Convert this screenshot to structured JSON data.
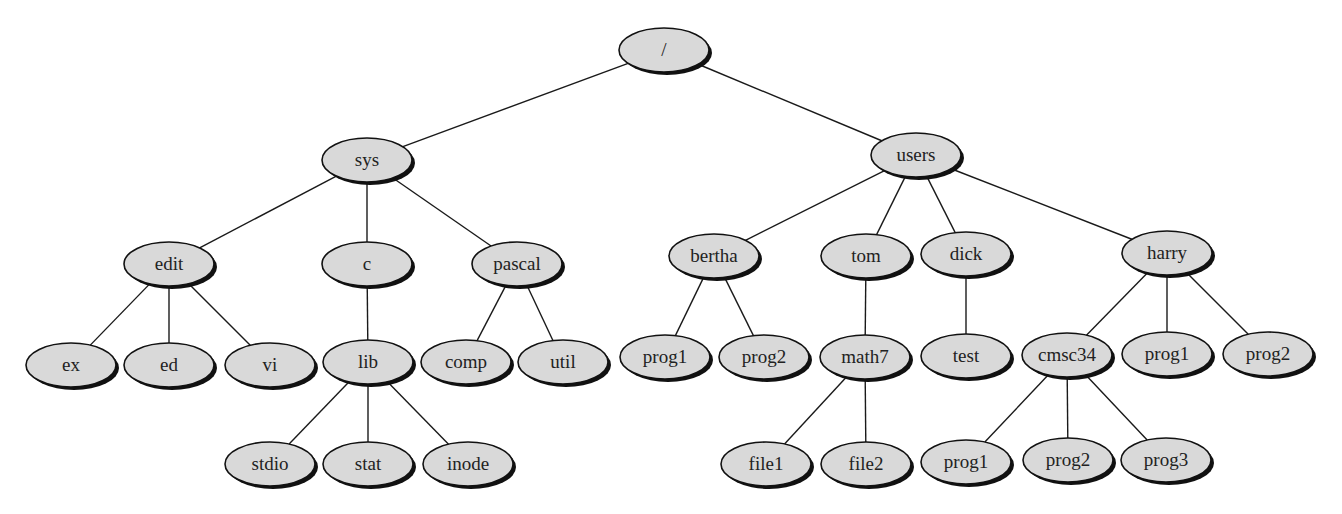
{
  "diagram": {
    "type": "directory-tree",
    "colors": {
      "node_fill": "#d9d9d9",
      "node_stroke": "#111111",
      "edge": "#1a1a1a",
      "background": "#ffffff"
    },
    "nodes": [
      {
        "id": "root",
        "label": "/",
        "x": 664,
        "y": 50,
        "rx": 45,
        "ry": 22
      },
      {
        "id": "sys",
        "label": "sys",
        "x": 367,
        "y": 160,
        "rx": 45,
        "ry": 22
      },
      {
        "id": "users",
        "label": "users",
        "x": 916,
        "y": 155,
        "rx": 45,
        "ry": 22
      },
      {
        "id": "edit",
        "label": "edit",
        "x": 169,
        "y": 264,
        "rx": 45,
        "ry": 22
      },
      {
        "id": "c",
        "label": "c",
        "x": 367,
        "y": 264,
        "rx": 45,
        "ry": 22
      },
      {
        "id": "pascal",
        "label": "pascal",
        "x": 517,
        "y": 264,
        "rx": 45,
        "ry": 22
      },
      {
        "id": "ex",
        "label": "ex",
        "x": 71,
        "y": 365,
        "rx": 45,
        "ry": 22
      },
      {
        "id": "ed",
        "label": "ed",
        "x": 169,
        "y": 365,
        "rx": 45,
        "ry": 22
      },
      {
        "id": "vi",
        "label": "vi",
        "x": 270,
        "y": 365,
        "rx": 45,
        "ry": 22
      },
      {
        "id": "lib",
        "label": "lib",
        "x": 368,
        "y": 362,
        "rx": 45,
        "ry": 22
      },
      {
        "id": "comp",
        "label": "comp",
        "x": 466,
        "y": 362,
        "rx": 45,
        "ry": 22
      },
      {
        "id": "util",
        "label": "util",
        "x": 563,
        "y": 362,
        "rx": 45,
        "ry": 22
      },
      {
        "id": "stdio",
        "label": "stdio",
        "x": 270,
        "y": 464,
        "rx": 45,
        "ry": 22
      },
      {
        "id": "stat",
        "label": "stat",
        "x": 368,
        "y": 464,
        "rx": 45,
        "ry": 22
      },
      {
        "id": "inode",
        "label": "inode",
        "x": 468,
        "y": 464,
        "rx": 45,
        "ry": 22
      },
      {
        "id": "bertha",
        "label": "bertha",
        "x": 714,
        "y": 256,
        "rx": 45,
        "ry": 22
      },
      {
        "id": "tom",
        "label": "tom",
        "x": 866,
        "y": 256,
        "rx": 45,
        "ry": 22
      },
      {
        "id": "dick",
        "label": "dick",
        "x": 966,
        "y": 254,
        "rx": 45,
        "ry": 22
      },
      {
        "id": "harry",
        "label": "harry",
        "x": 1167,
        "y": 253,
        "rx": 45,
        "ry": 22
      },
      {
        "id": "b_prog1",
        "label": "prog1",
        "x": 665,
        "y": 357,
        "rx": 45,
        "ry": 22
      },
      {
        "id": "b_prog2",
        "label": "prog2",
        "x": 764,
        "y": 357,
        "rx": 45,
        "ry": 22
      },
      {
        "id": "math7",
        "label": "math7",
        "x": 865,
        "y": 357,
        "rx": 45,
        "ry": 22
      },
      {
        "id": "test",
        "label": "test",
        "x": 966,
        "y": 356,
        "rx": 45,
        "ry": 22
      },
      {
        "id": "cmsc34",
        "label": "cmsc34",
        "x": 1067,
        "y": 355,
        "rx": 45,
        "ry": 22
      },
      {
        "id": "h_prog1",
        "label": "prog1",
        "x": 1167,
        "y": 354,
        "rx": 45,
        "ry": 22
      },
      {
        "id": "h_prog2",
        "label": "prog2",
        "x": 1268,
        "y": 354,
        "rx": 45,
        "ry": 22
      },
      {
        "id": "file1",
        "label": "file1",
        "x": 766,
        "y": 464,
        "rx": 45,
        "ry": 22
      },
      {
        "id": "file2",
        "label": "file2",
        "x": 866,
        "y": 464,
        "rx": 45,
        "ry": 22
      },
      {
        "id": "c_prog1",
        "label": "prog1",
        "x": 966,
        "y": 462,
        "rx": 45,
        "ry": 22
      },
      {
        "id": "c_prog2",
        "label": "prog2",
        "x": 1068,
        "y": 460,
        "rx": 45,
        "ry": 22
      },
      {
        "id": "c_prog3",
        "label": "prog3",
        "x": 1166,
        "y": 460,
        "rx": 45,
        "ry": 22
      }
    ],
    "edges": [
      [
        "root",
        "sys"
      ],
      [
        "root",
        "users"
      ],
      [
        "sys",
        "edit"
      ],
      [
        "sys",
        "c"
      ],
      [
        "sys",
        "pascal"
      ],
      [
        "edit",
        "ex"
      ],
      [
        "edit",
        "ed"
      ],
      [
        "edit",
        "vi"
      ],
      [
        "c",
        "lib"
      ],
      [
        "pascal",
        "comp"
      ],
      [
        "pascal",
        "util"
      ],
      [
        "lib",
        "stdio"
      ],
      [
        "lib",
        "stat"
      ],
      [
        "lib",
        "inode"
      ],
      [
        "users",
        "bertha"
      ],
      [
        "users",
        "tom"
      ],
      [
        "users",
        "dick"
      ],
      [
        "users",
        "harry"
      ],
      [
        "bertha",
        "b_prog1"
      ],
      [
        "bertha",
        "b_prog2"
      ],
      [
        "tom",
        "math7"
      ],
      [
        "dick",
        "test"
      ],
      [
        "harry",
        "cmsc34"
      ],
      [
        "harry",
        "h_prog1"
      ],
      [
        "harry",
        "h_prog2"
      ],
      [
        "math7",
        "file1"
      ],
      [
        "math7",
        "file2"
      ],
      [
        "cmsc34",
        "c_prog1"
      ],
      [
        "cmsc34",
        "c_prog2"
      ],
      [
        "cmsc34",
        "c_prog3"
      ]
    ]
  }
}
